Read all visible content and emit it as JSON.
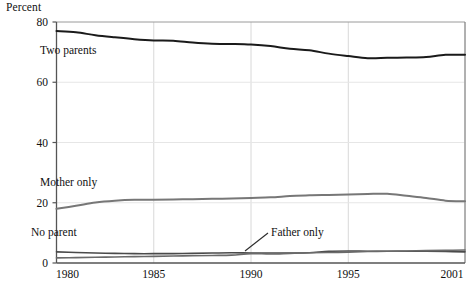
{
  "axis_title": "Percent",
  "y_ticks": [
    "0",
    "20",
    "40",
    "60",
    "80"
  ],
  "x_ticks": [
    "1980",
    "1985",
    "1990",
    "1995",
    "2001"
  ],
  "series_labels": {
    "two_parents": "Two parents",
    "mother_only": "Mother only",
    "no_parent": "No parent",
    "father_only": "Father only"
  },
  "colors": {
    "two_parents": "#1a1a1a",
    "mother_only": "#777777",
    "no_parent": "#4a4a4a",
    "father_only": "#6a6a6a",
    "frame": "#555555",
    "gridline": "#d8d8d8",
    "text": "#111111"
  },
  "chart_data": {
    "type": "line",
    "title": "",
    "subtitle": "",
    "xlabel": "",
    "ylabel": "Percent",
    "xlim": [
      1980,
      2001
    ],
    "ylim": [
      0,
      80
    ],
    "yticks": [
      0,
      20,
      40,
      60,
      80
    ],
    "xticks": [
      1980,
      1985,
      1990,
      1995,
      2001
    ],
    "grid": "vertical-light",
    "legend": "inline-labels",
    "x": [
      1980,
      1981,
      1982,
      1983,
      1984,
      1985,
      1986,
      1987,
      1988,
      1989,
      1990,
      1991,
      1992,
      1993,
      1994,
      1995,
      1996,
      1997,
      1998,
      1999,
      2000,
      2001
    ],
    "series": [
      {
        "name": "Two parents",
        "values": [
          77.0,
          76.6,
          75.6,
          74.9,
          74.3,
          73.9,
          73.8,
          73.2,
          72.8,
          72.7,
          72.5,
          72.0,
          71.1,
          70.6,
          69.5,
          68.7,
          68.0,
          68.1,
          68.2,
          68.4,
          69.1,
          69.1
        ]
      },
      {
        "name": "Mother only",
        "values": [
          18.0,
          19.0,
          20.1,
          20.7,
          21.0,
          21.0,
          21.1,
          21.2,
          21.3,
          21.4,
          21.6,
          21.8,
          22.2,
          22.5,
          22.6,
          22.7,
          22.9,
          23.0,
          22.3,
          21.6,
          20.7,
          20.5
        ]
      },
      {
        "name": "No parent",
        "values": [
          3.7,
          3.5,
          3.3,
          3.2,
          3.1,
          3.1,
          3.1,
          3.2,
          3.3,
          3.4,
          3.3,
          3.3,
          3.3,
          3.4,
          3.9,
          4.0,
          3.9,
          3.9,
          3.9,
          3.9,
          3.8,
          3.7
        ]
      },
      {
        "name": "Father only",
        "values": [
          1.7,
          1.8,
          1.9,
          2.0,
          2.1,
          2.2,
          2.3,
          2.4,
          2.5,
          2.6,
          3.1,
          3.0,
          3.2,
          3.4,
          3.5,
          3.6,
          3.8,
          3.9,
          4.0,
          4.1,
          4.2,
          4.3
        ]
      }
    ]
  }
}
